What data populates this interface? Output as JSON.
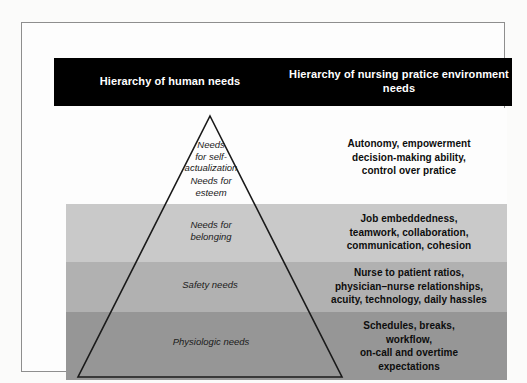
{
  "figure": {
    "type": "pyramid-comparison-diagram",
    "columns": {
      "left_header": "Hierarchy of human\nneeds",
      "right_header": "Hierarchy of nursing pratice\nenvironment needs"
    },
    "colors": {
      "header_bar": "#000000",
      "header_text": "#ffffff",
      "band_tier_1": "#fdfdfd",
      "band_tier_2": "#c9c9c9",
      "band_tier_3": "#b1b1b1",
      "band_tier_4": "#969696",
      "pyramid_outline": "#1a1a1a",
      "frame_border": "#8e8e8e"
    },
    "tiers": [
      {
        "index": 1,
        "human_need": "Needs\nfor self-\nactualization",
        "human_need_secondary": "Needs for\nesteem",
        "nursing_need": "Autonomy, empowerment\ndecision-making ability,\ncontrol over pratice",
        "shade": "#fdfdfd"
      },
      {
        "index": 2,
        "human_need": "Needs for\nbelonging",
        "nursing_need": "Job embeddedness,\nteamwork, collaboration,\ncommunication, cohesion",
        "shade": "#c9c9c9"
      },
      {
        "index": 3,
        "human_need": "Safety needs",
        "nursing_need": "Nurse to patient ratios,\nphysician–nurse relationships,\nacuity, technology, daily hassles",
        "shade": "#b1b1b1"
      },
      {
        "index": 4,
        "human_need": "Physiologic needs",
        "nursing_need": "Schedules, breaks,\nworkflow,\non-call and overtime\nexpectations",
        "shade": "#969696"
      }
    ]
  }
}
